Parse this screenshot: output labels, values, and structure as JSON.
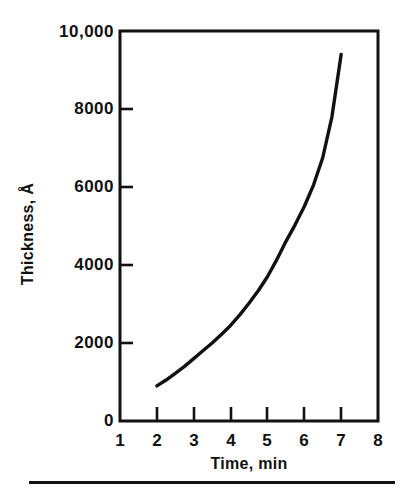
{
  "chart_data": {
    "type": "line",
    "title": "",
    "subtitle": "",
    "xlabel": "Time, min",
    "ylabel": "Thickness, Å",
    "xlim": [
      1,
      8
    ],
    "ylim": [
      0,
      10000
    ],
    "grid": false,
    "legend": null,
    "x_ticks": [
      {
        "value": 1,
        "label": "1"
      },
      {
        "value": 2,
        "label": "2"
      },
      {
        "value": 3,
        "label": "3"
      },
      {
        "value": 4,
        "label": "4"
      },
      {
        "value": 5,
        "label": "5"
      },
      {
        "value": 6,
        "label": "6"
      },
      {
        "value": 7,
        "label": "7"
      },
      {
        "value": 8,
        "label": "8"
      }
    ],
    "y_ticks": [
      {
        "value": 0,
        "label": "0"
      },
      {
        "value": 2000,
        "label": "2000"
      },
      {
        "value": 4000,
        "label": "4000"
      },
      {
        "value": 6000,
        "label": "6000"
      },
      {
        "value": 8000,
        "label": "8000"
      },
      {
        "value": 10000,
        "label": "10,000"
      }
    ],
    "series": [
      {
        "name": "Thickness vs Time",
        "color": "#111111",
        "x": [
          2.0,
          2.25,
          2.5,
          2.75,
          3.0,
          3.25,
          3.5,
          3.75,
          4.0,
          4.25,
          4.5,
          4.75,
          5.0,
          5.25,
          5.5,
          5.75,
          6.0,
          6.25,
          6.5,
          6.75,
          7.0
        ],
        "y": [
          900,
          1050,
          1220,
          1400,
          1600,
          1800,
          2000,
          2220,
          2450,
          2720,
          3020,
          3340,
          3700,
          4130,
          4600,
          5030,
          5500,
          6050,
          6750,
          7800,
          9400
        ]
      }
    ],
    "annotations": []
  },
  "axes": {
    "x_axis_name": "time-axis",
    "y_axis_name": "thickness-axis"
  }
}
